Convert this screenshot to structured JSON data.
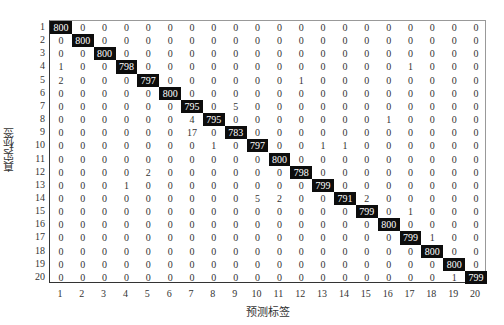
{
  "chart_data": {
    "type": "heatmap",
    "title": "",
    "xlabel": "预测标签",
    "ylabel": "真实标签",
    "x_ticks": [
      "1",
      "2",
      "3",
      "4",
      "5",
      "6",
      "7",
      "8",
      "9",
      "10",
      "11",
      "12",
      "13",
      "14",
      "15",
      "16",
      "17",
      "18",
      "19",
      "20"
    ],
    "y_ticks": [
      "1",
      "2",
      "3",
      "4",
      "5",
      "6",
      "7",
      "8",
      "9",
      "10",
      "11",
      "12",
      "13",
      "14",
      "15",
      "16",
      "17",
      "18",
      "19",
      "20"
    ],
    "matrix": [
      [
        800,
        0,
        0,
        0,
        0,
        0,
        0,
        0,
        0,
        0,
        0,
        0,
        0,
        0,
        0,
        0,
        0,
        0,
        0,
        0
      ],
      [
        0,
        800,
        0,
        0,
        0,
        0,
        0,
        0,
        0,
        0,
        0,
        0,
        0,
        0,
        0,
        0,
        0,
        0,
        0,
        0
      ],
      [
        0,
        0,
        800,
        0,
        0,
        0,
        0,
        0,
        0,
        0,
        0,
        0,
        0,
        0,
        0,
        0,
        0,
        0,
        0,
        0
      ],
      [
        1,
        0,
        0,
        798,
        0,
        0,
        0,
        0,
        0,
        0,
        0,
        0,
        0,
        0,
        0,
        0,
        1,
        0,
        0,
        0
      ],
      [
        2,
        0,
        0,
        0,
        797,
        0,
        0,
        0,
        0,
        0,
        0,
        1,
        0,
        0,
        0,
        0,
        0,
        0,
        0,
        0
      ],
      [
        0,
        0,
        0,
        0,
        0,
        800,
        0,
        0,
        0,
        0,
        0,
        0,
        0,
        0,
        0,
        0,
        0,
        0,
        0,
        0
      ],
      [
        0,
        0,
        0,
        0,
        0,
        0,
        795,
        0,
        5,
        0,
        0,
        0,
        0,
        0,
        0,
        0,
        0,
        0,
        0,
        0
      ],
      [
        0,
        0,
        0,
        0,
        0,
        0,
        4,
        795,
        0,
        0,
        0,
        0,
        0,
        0,
        0,
        1,
        0,
        0,
        0,
        0
      ],
      [
        0,
        0,
        0,
        0,
        0,
        0,
        17,
        0,
        783,
        0,
        0,
        0,
        0,
        0,
        0,
        0,
        0,
        0,
        0,
        0
      ],
      [
        0,
        0,
        0,
        0,
        0,
        0,
        0,
        1,
        0,
        797,
        0,
        0,
        1,
        1,
        0,
        0,
        0,
        0,
        0,
        0
      ],
      [
        0,
        0,
        0,
        0,
        0,
        0,
        0,
        0,
        0,
        0,
        800,
        0,
        0,
        0,
        0,
        0,
        0,
        0,
        0,
        0
      ],
      [
        0,
        0,
        0,
        0,
        2,
        0,
        0,
        0,
        0,
        0,
        0,
        798,
        0,
        0,
        0,
        0,
        0,
        0,
        0,
        0
      ],
      [
        0,
        0,
        0,
        1,
        0,
        0,
        0,
        0,
        0,
        0,
        0,
        0,
        799,
        0,
        0,
        0,
        0,
        0,
        0,
        0
      ],
      [
        0,
        0,
        0,
        0,
        0,
        0,
        0,
        0,
        0,
        5,
        2,
        0,
        0,
        791,
        2,
        0,
        0,
        0,
        0,
        0
      ],
      [
        0,
        0,
        0,
        0,
        0,
        0,
        0,
        0,
        0,
        0,
        0,
        0,
        0,
        0,
        799,
        0,
        1,
        0,
        0,
        0
      ],
      [
        0,
        0,
        0,
        0,
        0,
        0,
        0,
        0,
        0,
        0,
        0,
        0,
        0,
        0,
        0,
        800,
        0,
        0,
        0,
        0
      ],
      [
        0,
        0,
        0,
        0,
        0,
        0,
        0,
        0,
        0,
        0,
        0,
        0,
        0,
        0,
        0,
        0,
        799,
        1,
        0,
        0
      ],
      [
        0,
        0,
        0,
        0,
        0,
        0,
        0,
        0,
        0,
        0,
        0,
        0,
        0,
        0,
        0,
        0,
        0,
        800,
        0,
        0
      ],
      [
        0,
        0,
        0,
        0,
        0,
        0,
        0,
        0,
        0,
        0,
        0,
        0,
        0,
        0,
        0,
        0,
        0,
        0,
        800,
        0
      ],
      [
        0,
        0,
        0,
        0,
        0,
        0,
        0,
        0,
        0,
        0,
        0,
        0,
        0,
        0,
        0,
        0,
        0,
        0,
        1,
        799
      ]
    ],
    "highlight": "diagonal cells rendered white text on black",
    "colors": {
      "diagonal_bg": "#0d0d0d",
      "diagonal_text": "#ffffff",
      "cell_text": "#333333",
      "background": "#ffffff"
    },
    "grid": false,
    "legend": null
  }
}
